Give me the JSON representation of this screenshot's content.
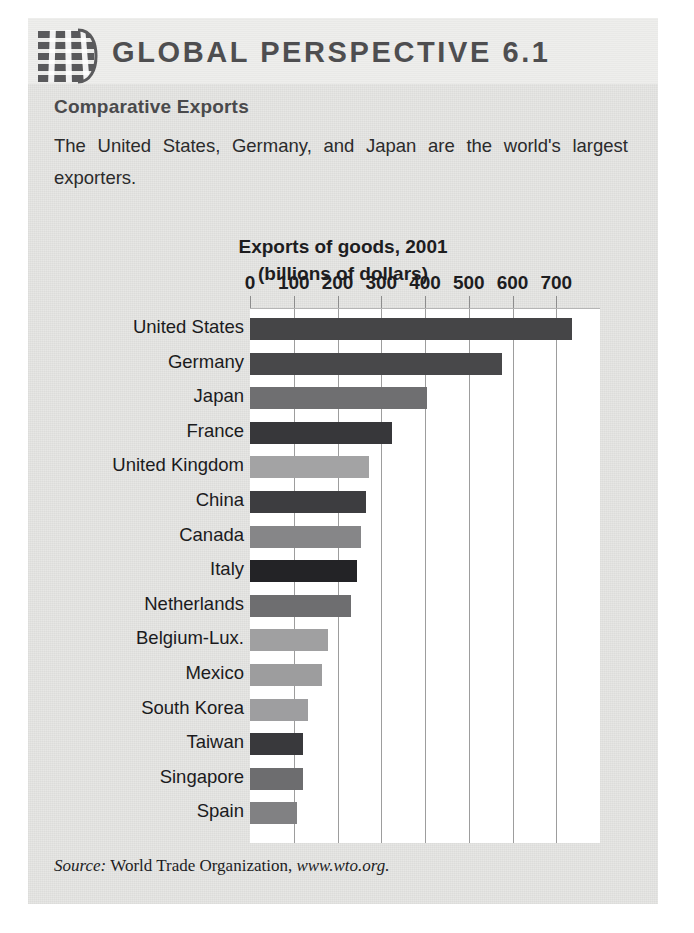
{
  "masthead": {
    "title": "GLOBAL PERSPECTIVE 6.1",
    "logo_icon": "globe-grid-icon"
  },
  "article": {
    "subhead": "Comparative Exports",
    "intro": "The United States, Germany, and Japan are the world's largest exporters."
  },
  "source": {
    "label": "Source:",
    "publisher": " World Trade Organization, ",
    "url": "www.wto.org."
  },
  "colors": {
    "panel_background": "#e7e7e5",
    "masthead_background": "#eeeeec",
    "plot_background": "#ffffff",
    "gridline": "#9d9d9d",
    "title_text": "#1d1d1f",
    "masthead_text": "#4e4e50"
  },
  "chart_data": {
    "type": "bar",
    "orientation": "horizontal",
    "title": "Exports of goods, 2001",
    "subtitle": "(billions of dollars)",
    "xlabel": "",
    "ylabel": "",
    "xlim": [
      0,
      800
    ],
    "grid": true,
    "legend": "none",
    "xticks": [
      0,
      100,
      200,
      300,
      400,
      500,
      600,
      700
    ],
    "xticklabels": [
      "0",
      "100",
      "200",
      "300",
      "400",
      "500",
      "600",
      "700"
    ],
    "categories": [
      "United States",
      "Germany",
      "Japan",
      "France",
      "United Kingdom",
      "China",
      "Canada",
      "Italy",
      "Netherlands",
      "Belgium-Lux.",
      "Mexico",
      "South Korea",
      "Taiwan",
      "Singapore",
      "Spain"
    ],
    "values": [
      737,
      576,
      404,
      324,
      272,
      266,
      253,
      244,
      230,
      179,
      164,
      133,
      122,
      122,
      107
    ],
    "bar_colors": [
      "#454547",
      "#48484a",
      "#6f6f71",
      "#37373a",
      "#a3a3a4",
      "#3d3d40",
      "#868688",
      "#232326",
      "#6e6e70",
      "#a0a0a1",
      "#9d9d9e",
      "#9e9ea0",
      "#39393c",
      "#6d6d6f",
      "#818183"
    ]
  }
}
